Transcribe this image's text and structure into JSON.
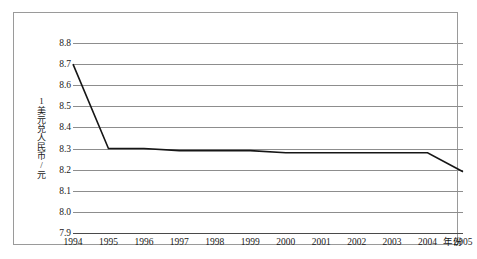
{
  "chart_data": {
    "type": "line",
    "title": "",
    "subtitle": "",
    "xlabel": "年份",
    "ylabel": "1美元兑人民币/元",
    "x": [
      1994,
      1995,
      1996,
      1997,
      1998,
      1999,
      2000,
      2001,
      2002,
      2003,
      2004,
      2005
    ],
    "xtick_labels": [
      "1994",
      "1995",
      "1996",
      "1997",
      "1998",
      "1999",
      "2000",
      "2001",
      "2002",
      "2003",
      "2004",
      "2005"
    ],
    "values": [
      8.7,
      8.3,
      8.3,
      8.29,
      8.29,
      8.29,
      8.28,
      8.28,
      8.28,
      8.28,
      8.28,
      8.19
    ],
    "series": [
      {
        "name": "1美元兑人民币/元",
        "values": [
          8.7,
          8.3,
          8.3,
          8.29,
          8.29,
          8.29,
          8.28,
          8.28,
          8.28,
          8.28,
          8.28,
          8.19
        ]
      }
    ],
    "ylim": [
      7.9,
      8.8
    ],
    "ytick_labels": [
      "8.8",
      "8.7",
      "8.6",
      "8.5",
      "8.4",
      "8.3",
      "8.2",
      "8.1",
      "8.0",
      "7.9"
    ],
    "ytick_values": [
      8.8,
      8.7,
      8.6,
      8.5,
      8.4,
      8.3,
      8.2,
      8.1,
      8.0,
      7.9
    ],
    "ystep": 0.1,
    "grid": true,
    "legend": false,
    "legend_position": "none",
    "markers": false,
    "annotations": [],
    "colors": {
      "line": "#161616",
      "gridline": "#8d8d8d",
      "axis": "#4a4a4a",
      "frame": "#9a9a9a",
      "background": "#ffffff",
      "text": "#1a1a1a"
    }
  }
}
